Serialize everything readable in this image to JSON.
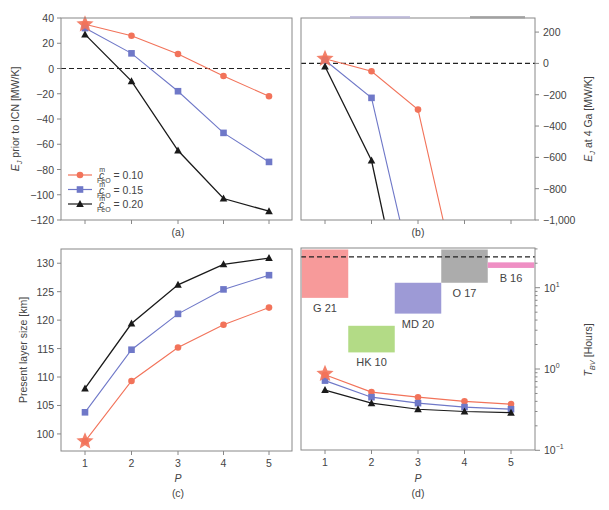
{
  "figure": {
    "colors": {
      "c010": "#f2735a",
      "c015": "#6f78c8",
      "c020": "#1a1a1a",
      "axis": "#888888",
      "dashed": "#222222"
    },
    "x_label": "P",
    "x_ticks": [
      "1",
      "2",
      "3",
      "4",
      "5"
    ]
  },
  "chart_data": [
    {
      "panel": "(a)",
      "type": "line",
      "ylabel": "E_J prior to ICN [MW/K]",
      "ylabel_main": "E",
      "ylabel_sub": "J",
      "ylabel_rest": " prior to ICN [MW/K]",
      "x": [
        1,
        2,
        3,
        4,
        5
      ],
      "ylim": [
        -120,
        40
      ],
      "yticks": [
        40,
        20,
        0,
        -20,
        -40,
        -60,
        -80,
        -100,
        -120
      ],
      "ytick_labels": [
        "40",
        "20",
        "0",
        "−20",
        "−40",
        "−60",
        "−80",
        "−100",
        "−120"
      ],
      "reference_line": 0,
      "series": [
        {
          "name": "c_FeO^m = 0.10",
          "marker": "circle",
          "values": [
            35,
            26,
            11.5,
            -6,
            -22
          ]
        },
        {
          "name": "c_FeO^m = 0.15",
          "marker": "square",
          "values": [
            32,
            12,
            -18,
            -51,
            -74
          ]
        },
        {
          "name": "c_FeO^m = 0.20",
          "marker": "triangle",
          "values": [
            27,
            -10,
            -65,
            -103,
            -113
          ]
        }
      ],
      "annotation": "star at P=1 (c=0.10)",
      "legend": [
        {
          "prefix": "c",
          "sup": "m",
          "sub": "FeO",
          "value": " = 0.10"
        },
        {
          "prefix": "c",
          "sup": "m",
          "sub": "FeO",
          "value": " = 0.15"
        },
        {
          "prefix": "c",
          "sup": "m",
          "sub": "FeO",
          "value": " = 0.20"
        }
      ],
      "legend_position": "lower left"
    },
    {
      "panel": "(b)",
      "type": "line",
      "ylabel": "E_J at 4 Ga [MW/K]",
      "ylabel_main": "E",
      "ylabel_sub": "J",
      "ylabel_rest": " at 4 Ga [MW/K]",
      "x": [
        1,
        2,
        3,
        4,
        5
      ],
      "ylim": [
        -1000,
        290
      ],
      "yticks": [
        200,
        0,
        -200,
        -400,
        -600,
        -800,
        -1000
      ],
      "ytick_labels": [
        "200",
        "0",
        "−200",
        "−400",
        "−600",
        "−800",
        "−1,000"
      ],
      "yaxis_side": "right",
      "reference_line": 0,
      "series": [
        {
          "name": "c_FeO^m = 0.10",
          "values": [
            30,
            -50,
            -295,
            -1600,
            null
          ]
        },
        {
          "name": "c_FeO^m = 0.15",
          "values": [
            20,
            -220,
            -1500,
            null,
            null
          ]
        },
        {
          "name": "c_FeO^m = 0.20",
          "values": [
            -20,
            -620,
            -2000,
            null,
            null
          ]
        }
      ],
      "note": "lines continue below -1,000 (off scale)"
    },
    {
      "panel": "(c)",
      "type": "line",
      "ylabel": "Present layer size [km]",
      "xlabel": "P",
      "x": [
        1,
        2,
        3,
        4,
        5
      ],
      "ylim": [
        97,
        132.5
      ],
      "yticks": [
        100,
        105,
        110,
        115,
        120,
        125,
        130
      ],
      "ytick_labels": [
        "100",
        "105",
        "110",
        "115",
        "120",
        "125",
        "130"
      ],
      "series": [
        {
          "name": "c_FeO^m = 0.10",
          "values": [
            98.7,
            109.3,
            115.2,
            119.2,
            122.2
          ]
        },
        {
          "name": "c_FeO^m = 0.15",
          "values": [
            103.8,
            114.8,
            121.1,
            125.4,
            127.9
          ]
        },
        {
          "name": "c_FeO^m = 0.20",
          "values": [
            108.0,
            119.4,
            126.2,
            129.8,
            130.9
          ]
        }
      ]
    },
    {
      "panel": "(d)",
      "type": "line",
      "ylabel": "T_BV [Hours]",
      "ylabel_main": "T",
      "ylabel_sub": "BV",
      "ylabel_rest": " [Hours]",
      "xlabel": "P",
      "yscale": "log",
      "yaxis_side": "right",
      "x": [
        1,
        2,
        3,
        4,
        5
      ],
      "ylim": [
        0.1,
        29.5
      ],
      "yticks": [
        0.1,
        1,
        10
      ],
      "ytick_labels": [
        [
          "10",
          "−1"
        ],
        [
          "10",
          "0"
        ],
        [
          "10",
          "1"
        ]
      ],
      "reference_line": 24,
      "series": [
        {
          "name": "c_FeO^m = 0.10",
          "values": [
            0.85,
            0.52,
            0.45,
            0.4,
            0.37
          ]
        },
        {
          "name": "c_FeO^m = 0.15",
          "values": [
            0.72,
            0.45,
            0.38,
            0.34,
            0.32
          ]
        },
        {
          "name": "c_FeO^m = 0.20",
          "values": [
            0.55,
            0.38,
            0.32,
            0.3,
            0.29
          ]
        }
      ],
      "ranges": [
        {
          "label": "G 21",
          "x0": 0.5,
          "x1": 1.5,
          "y0": 7.5,
          "y1": 29.5,
          "color": "#f79a9a"
        },
        {
          "label": "HK 10",
          "x0": 1.5,
          "x1": 2.5,
          "y0": 1.6,
          "y1": 3.4,
          "color": "#b3db86"
        },
        {
          "label": "MD 20",
          "x0": 2.5,
          "x1": 3.5,
          "y0": 4.8,
          "y1": 11.5,
          "color": "#9d9ad6"
        },
        {
          "label": "O 17",
          "x0": 3.5,
          "x1": 4.5,
          "y0": 11.5,
          "y1": 29.5,
          "color": "#acacac"
        },
        {
          "label": "B 16",
          "x0": 4.5,
          "x1": 5.5,
          "y0": 17.5,
          "y1": 20.5,
          "color": "#ef8fc4"
        }
      ]
    }
  ],
  "panel_labels": [
    "(a)",
    "(b)",
    "(c)",
    "(d)"
  ]
}
